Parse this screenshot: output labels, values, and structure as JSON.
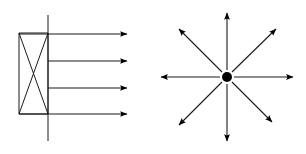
{
  "figure": {
    "background_color": "#ffffff",
    "line_color": "#1a1a1a",
    "fill_color": "#000000",
    "width": 306,
    "height": 154
  },
  "panels": [
    {
      "id": "parallel-beam-source",
      "name": "Parallel beam source",
      "description": "Rectangle with internal X crossed by a vertical line, emitting four parallel horizontal arrows to the right",
      "body": {
        "name": "source-rectangle",
        "x": 19,
        "y": 33,
        "width": 29,
        "height": 81
      },
      "cross": {
        "name": "rectangle-x-cross",
        "diagonals": [
          {
            "x1": 19,
            "y1": 33,
            "x2": 48,
            "y2": 114
          },
          {
            "x1": 48,
            "y1": 33,
            "x2": 19,
            "y2": 114
          }
        ]
      },
      "axis": {
        "name": "vertical-axis-line",
        "x": 48,
        "y1": 15,
        "y2": 141
      },
      "rays": [
        {
          "name": "beam-ray-1",
          "x1": 19,
          "y1": 34,
          "x2": 127,
          "y2": 34
        },
        {
          "name": "beam-ray-2",
          "x1": 48,
          "y1": 61,
          "x2": 127,
          "y2": 61
        },
        {
          "name": "beam-ray-3",
          "x1": 48,
          "y1": 88,
          "x2": 127,
          "y2": 88
        },
        {
          "name": "beam-ray-4",
          "x1": 19,
          "y1": 114,
          "x2": 127,
          "y2": 114
        }
      ]
    },
    {
      "id": "point-source",
      "name": "Point source",
      "description": "Filled circular point emitting eight arrows radiating outward in all directions",
      "center": {
        "name": "source-dot",
        "cx": 227,
        "cy": 77,
        "r": 5
      },
      "rays": [
        {
          "name": "radial-ray-up",
          "direction": "up",
          "angle_deg": 90,
          "x1": 227,
          "y1": 70,
          "x2": 227,
          "y2": 13
        },
        {
          "name": "radial-ray-upright",
          "direction": "up-right",
          "angle_deg": 45,
          "x1": 232,
          "y1": 72,
          "x2": 276,
          "y2": 29
        },
        {
          "name": "radial-ray-right",
          "direction": "right",
          "angle_deg": 0,
          "x1": 234,
          "y1": 77,
          "x2": 293,
          "y2": 77
        },
        {
          "name": "radial-ray-downright",
          "direction": "down-right",
          "angle_deg": -45,
          "x1": 232,
          "y1": 82,
          "x2": 272,
          "y2": 122
        },
        {
          "name": "radial-ray-down",
          "direction": "down",
          "angle_deg": -90,
          "x1": 227,
          "y1": 84,
          "x2": 227,
          "y2": 141
        },
        {
          "name": "radial-ray-downleft",
          "direction": "down-left",
          "angle_deg": 225,
          "x1": 222,
          "y1": 82,
          "x2": 179,
          "y2": 125
        },
        {
          "name": "radial-ray-left",
          "direction": "left",
          "angle_deg": 180,
          "x1": 220,
          "y1": 77,
          "x2": 161,
          "y2": 77
        },
        {
          "name": "radial-ray-upleft",
          "direction": "up-left",
          "angle_deg": 135,
          "x1": 222,
          "y1": 72,
          "x2": 179,
          "y2": 29
        }
      ]
    }
  ]
}
